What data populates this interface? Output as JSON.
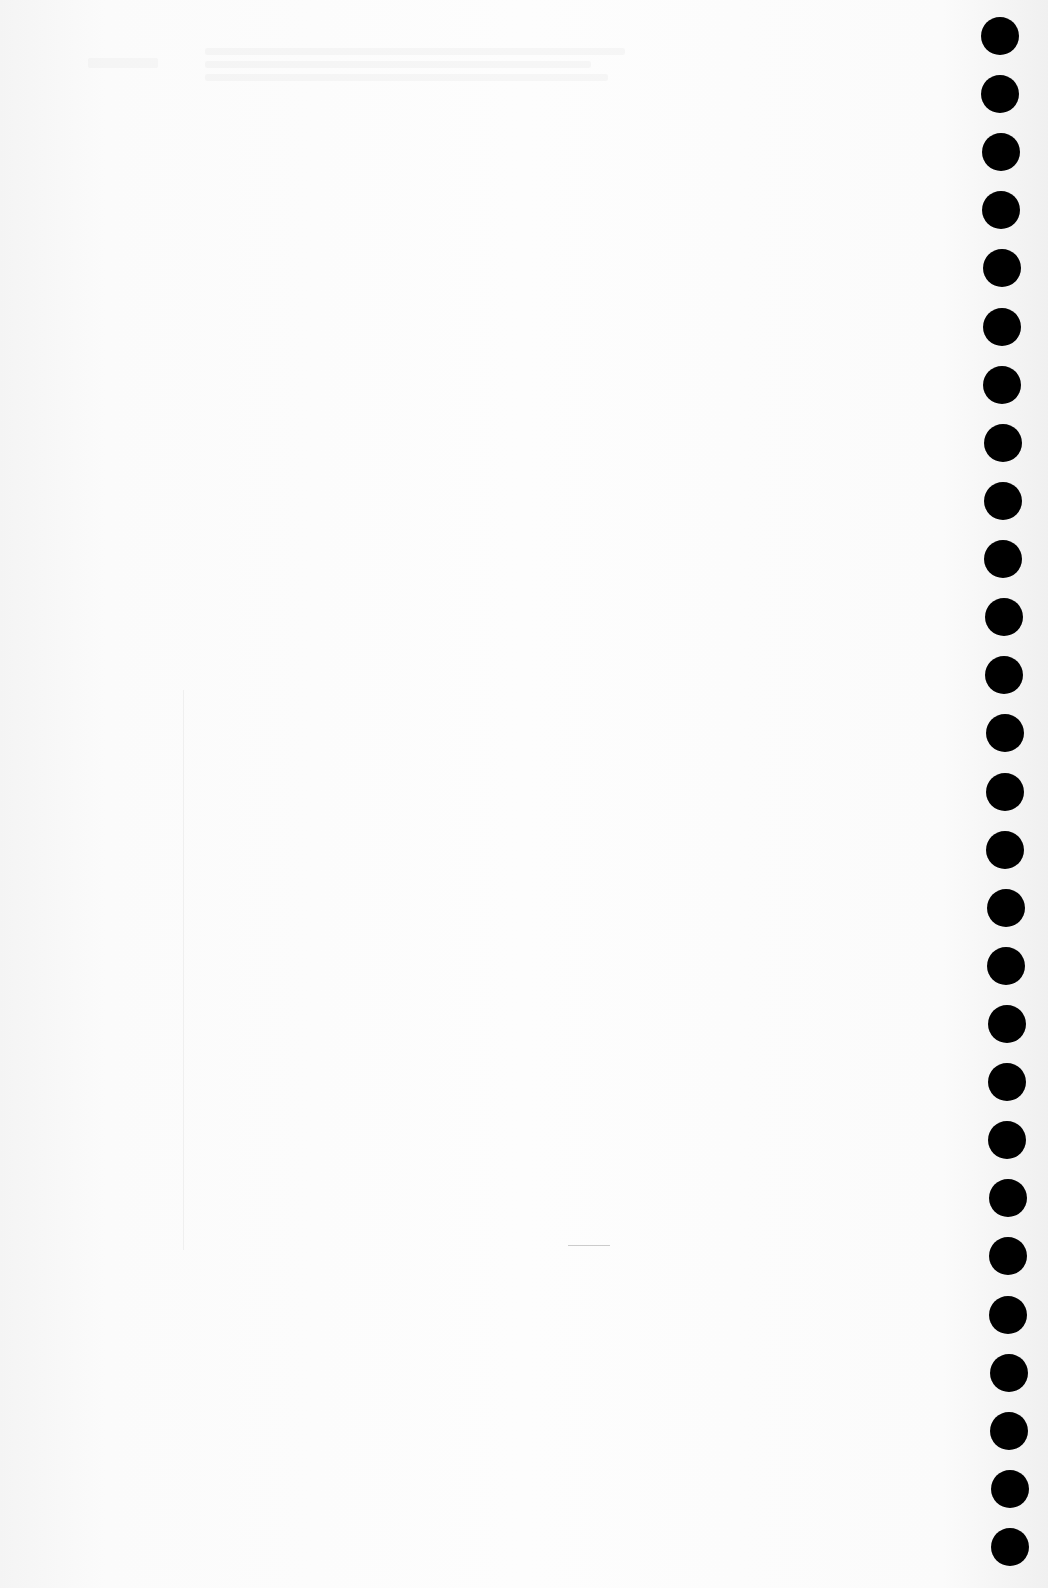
{
  "document": {
    "type": "blank notebook page (scan)",
    "content_text": "",
    "bleed_through_visible": true
  },
  "binding": {
    "style": "spiral punch holes",
    "side": "right",
    "hole_count": 27,
    "hole_color": "#000000",
    "paper_color": "#fbfbfb"
  }
}
